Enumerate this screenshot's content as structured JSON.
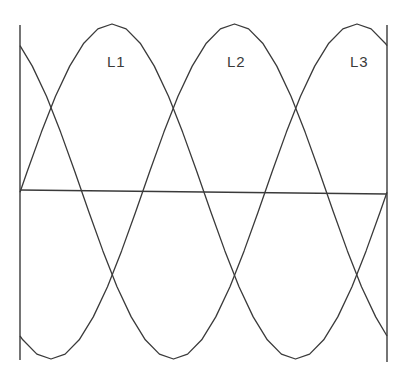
{
  "diagram": {
    "labels": [
      {
        "text": "L1",
        "x": 107,
        "y": 67
      },
      {
        "text": "L2",
        "x": 227,
        "y": 67
      },
      {
        "text": "L3",
        "x": 350,
        "y": 67
      }
    ],
    "phases": [
      {
        "name": "L1",
        "peak_x": 112
      },
      {
        "name": "L2",
        "peak_x": 234.5
      },
      {
        "name": "L3",
        "peak_x": 357
      }
    ],
    "geometry": {
      "left_x": 20,
      "right_x": 387,
      "center_y": 191.5,
      "amplitude": 167.5,
      "period_px": 367,
      "segments": 26,
      "axis_top_left": 25,
      "axis_bottom_left": 360,
      "axis_top_right": 25,
      "axis_bottom_right": 362,
      "baseline_left_y": 190,
      "baseline_right_y": 194
    },
    "line_color": "#3a3a3a"
  }
}
